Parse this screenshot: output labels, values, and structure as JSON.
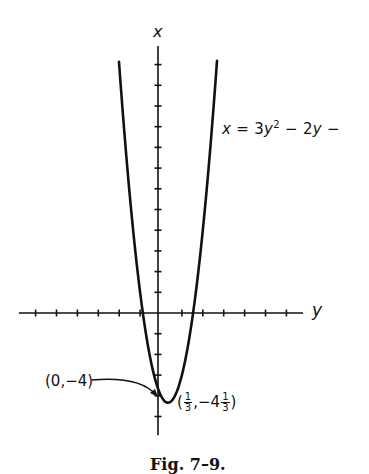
{
  "chart_data": {
    "type": "line",
    "title": "",
    "caption": "Fig. 7–9.",
    "xlabel": "y",
    "ylabel": "x",
    "equation_label": "x = 3y² − 2y −",
    "function": "x = 3y^2 - 2y - 4",
    "axes": {
      "horizontal": {
        "name": "y",
        "range": [
          -6.8,
          6.8
        ],
        "tick_step": 1,
        "ticks": [
          -6,
          -5,
          -4,
          -3,
          -2,
          -1,
          1,
          2,
          3,
          4,
          5,
          6
        ]
      },
      "vertical": {
        "name": "x",
        "range": [
          -5.9,
          12.9
        ],
        "tick_step": 1,
        "ticks": [
          -5,
          -4,
          -3,
          -2,
          -1,
          1,
          2,
          3,
          4,
          5,
          6,
          7,
          8,
          9,
          10,
          11,
          12
        ]
      }
    },
    "grid": false,
    "series": [
      {
        "name": "parabola",
        "y_range": [
          -2.01,
          2.68
        ],
        "points": [
          {
            "y": -2.0,
            "x": 12.0
          },
          {
            "y": -1.5,
            "x": 5.75
          },
          {
            "y": -1.0,
            "x": 1.0
          },
          {
            "y": -0.868,
            "x": 0.0
          },
          {
            "y": -0.5,
            "x": -2.25
          },
          {
            "y": 0.0,
            "x": -4.0
          },
          {
            "y": 0.3333,
            "x": -4.3333
          },
          {
            "y": 0.5,
            "x": -4.25
          },
          {
            "y": 1.0,
            "x": -3.0
          },
          {
            "y": 1.535,
            "x": 0.0
          },
          {
            "y": 2.0,
            "x": 4.0
          },
          {
            "y": 2.5,
            "x": 9.75
          },
          {
            "y": 2.68,
            "x": 12.2
          }
        ]
      }
    ],
    "annotations": [
      {
        "text": "(0,−4)",
        "point": {
          "y": 0,
          "x": -4
        },
        "arrow": true
      },
      {
        "text": "(1/3, −4 1/3)",
        "point": {
          "y": 0.3333,
          "x": -4.3333
        },
        "arrow": false
      }
    ]
  },
  "labels": {
    "x_axis": "x",
    "y_axis": "y",
    "eq_x": "x",
    "eq_eq": " = 3",
    "eq_y": "y",
    "eq_pow": "2",
    "eq_rest1": " − 2",
    "eq_y2": "y",
    "eq_rest2": " −",
    "pt1": "(0,−4)",
    "pt2_open": "(",
    "pt2_num": "1",
    "pt2_den": "3",
    "pt2_mid": ",−4",
    "pt2_num2": "1",
    "pt2_den2": "3",
    "pt2_close": ")",
    "caption": "Fig. 7–9."
  },
  "style": {
    "ink": "#111111",
    "background": "#ffffff"
  }
}
